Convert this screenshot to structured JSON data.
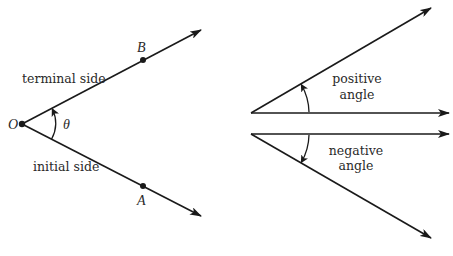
{
  "figure": {
    "left_diagram": {
      "vertex_label": "O",
      "angle_label": "θ",
      "terminal_point_label": "B",
      "initial_point_label": "A",
      "terminal_side_label": "terminal side",
      "initial_side_label": "initial side"
    },
    "right_diagram": {
      "positive": {
        "line1": "positive",
        "line2": "angle"
      },
      "negative": {
        "line1": "negative",
        "line2": "angle"
      }
    },
    "colors": {
      "ink": "#1a1a1a",
      "background": "#ffffff"
    }
  }
}
